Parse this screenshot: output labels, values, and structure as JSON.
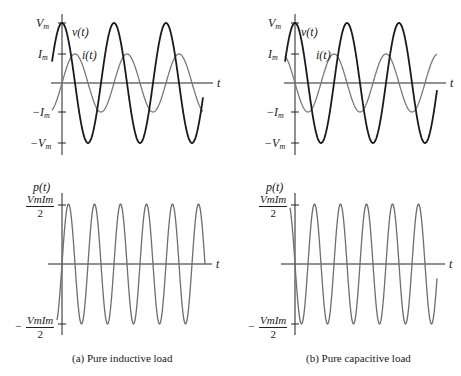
{
  "colors": {
    "voltage": "#1a1a1a",
    "current": "#7a7a7a",
    "power": "#6e6e6e",
    "axis": "#222222"
  },
  "panels": {
    "a": {
      "caption": "(a) Pure inductive load",
      "top": {
        "y_labels": {
          "vm": "V",
          "vm_sub": "m",
          "im": "I",
          "im_sub": "m",
          "neg_im": "−I",
          "neg_im_sub": "m",
          "neg_vm": "−V",
          "neg_vm_sub": "m"
        },
        "v_label": "v(t)",
        "i_label": "i(t)",
        "t_label": "t"
      },
      "bottom": {
        "p_label": "p(t)",
        "t_label": "t",
        "pos_num": "VmIm",
        "den": "2",
        "neg_sign": "−"
      }
    },
    "b": {
      "caption": "(b) Pure capacitive load",
      "top": {
        "y_labels": {
          "vm": "V",
          "vm_sub": "m",
          "im": "I",
          "im_sub": "m",
          "neg_im": "−I",
          "neg_im_sub": "m",
          "neg_vm": "−V",
          "neg_vm_sub": "m"
        },
        "v_label": "v(t)",
        "i_label": "i(t)",
        "t_label": "t"
      },
      "bottom": {
        "p_label": "p(t)",
        "t_label": "t",
        "pos_num": "VmIm",
        "den": "2",
        "neg_sign": "−"
      }
    }
  },
  "chart_data": [
    {
      "type": "line",
      "title": "Pure inductive load: v(t), i(t)",
      "series": [
        {
          "name": "v(t)",
          "function": "Vm cos(ωt)",
          "amplitude": "Vm"
        },
        {
          "name": "i(t)",
          "function": "Im cos(ωt − 90°)",
          "amplitude": "Im",
          "note": "current lags voltage by 90°"
        }
      ],
      "xlabel": "t",
      "yticks": [
        "Vm",
        "Im",
        "−Im",
        "−Vm"
      ],
      "cycles_shown": 3
    },
    {
      "type": "line",
      "title": "Pure inductive load: p(t)",
      "series": [
        {
          "name": "p(t)",
          "function": "(VmIm/2) sin(2ωt)"
        }
      ],
      "xlabel": "t",
      "yticks": [
        "VmIm/2",
        "−VmIm/2"
      ],
      "average_power": 0
    },
    {
      "type": "line",
      "title": "Pure capacitive load: v(t), i(t)",
      "series": [
        {
          "name": "v(t)",
          "function": "Vm cos(ωt)",
          "amplitude": "Vm"
        },
        {
          "name": "i(t)",
          "function": "Im cos(ωt + 90°)",
          "amplitude": "Im",
          "note": "current leads voltage by 90°"
        }
      ],
      "xlabel": "t",
      "yticks": [
        "Vm",
        "Im",
        "−Im",
        "−Vm"
      ],
      "cycles_shown": 3
    },
    {
      "type": "line",
      "title": "Pure capacitive load: p(t)",
      "series": [
        {
          "name": "p(t)",
          "function": "−(VmIm/2) sin(2ωt)"
        }
      ],
      "xlabel": "t",
      "yticks": [
        "VmIm/2",
        "−VmIm/2"
      ],
      "average_power": 0
    }
  ]
}
